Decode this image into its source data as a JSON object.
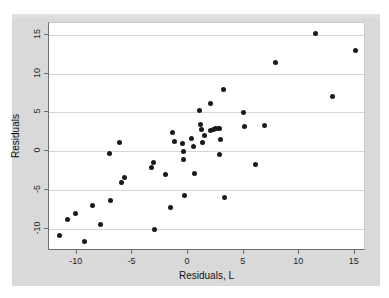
{
  "figure": {
    "background_color": "#d9d9d9",
    "plot_background_color": "#ffffff",
    "point_color": "#1a1a1a",
    "gridline_color": "#d5d5d5",
    "axis_color": "#6e6e6e"
  },
  "chart_data": {
    "type": "scatter",
    "title": "",
    "xlabel": "Residuals, L",
    "ylabel": "Residuals",
    "xlim": [
      -12.5,
      16.0
    ],
    "ylim": [
      -12.8,
      16.5
    ],
    "xticks": [
      -10,
      -5,
      0,
      5,
      10,
      15
    ],
    "xticklabels": [
      "-10",
      "-5",
      "0",
      "5",
      "10",
      "15"
    ],
    "yticks": [
      15,
      10,
      5,
      0,
      -5,
      -10
    ],
    "yticklabels": [
      "15",
      "10",
      "5",
      "0",
      "-5",
      "-10"
    ],
    "grid": "horizontal",
    "legend": null,
    "marker": "filled-circle",
    "points": [
      {
        "x": -11.6,
        "y": -10.8
      },
      {
        "x": -10.8,
        "y": -8.7
      },
      {
        "x": -10.1,
        "y": -8.0
      },
      {
        "x": -9.3,
        "y": -11.6
      },
      {
        "x": -8.6,
        "y": -7.0
      },
      {
        "x": -7.9,
        "y": -9.4
      },
      {
        "x": -7.1,
        "y": -0.3
      },
      {
        "x": -7.0,
        "y": -6.3
      },
      {
        "x": -6.2,
        "y": 1.1
      },
      {
        "x": -6.0,
        "y": -4.0
      },
      {
        "x": -5.7,
        "y": -3.3
      },
      {
        "x": -3.3,
        "y": -2.1
      },
      {
        "x": -3.1,
        "y": -1.4
      },
      {
        "x": -3.0,
        "y": -10.1
      },
      {
        "x": -2.0,
        "y": -3.0
      },
      {
        "x": -1.6,
        "y": -7.2
      },
      {
        "x": -1.4,
        "y": 2.4
      },
      {
        "x": -1.2,
        "y": 1.3
      },
      {
        "x": -0.5,
        "y": 1.0
      },
      {
        "x": -0.4,
        "y": 0.0
      },
      {
        "x": -0.4,
        "y": -1.1
      },
      {
        "x": -0.3,
        "y": -5.7
      },
      {
        "x": 0.3,
        "y": 1.6
      },
      {
        "x": 0.5,
        "y": 0.6
      },
      {
        "x": 0.6,
        "y": -2.9
      },
      {
        "x": 1.0,
        "y": 5.2
      },
      {
        "x": 1.1,
        "y": 3.4
      },
      {
        "x": 1.2,
        "y": 2.8
      },
      {
        "x": 1.3,
        "y": 1.2
      },
      {
        "x": 1.5,
        "y": 2.0
      },
      {
        "x": 2.0,
        "y": 6.2
      },
      {
        "x": 2.0,
        "y": 2.7
      },
      {
        "x": 2.3,
        "y": 2.8
      },
      {
        "x": 2.5,
        "y": 2.9
      },
      {
        "x": 2.7,
        "y": 2.9
      },
      {
        "x": 2.8,
        "y": 2.9
      },
      {
        "x": 2.8,
        "y": -0.4
      },
      {
        "x": 2.9,
        "y": 1.5
      },
      {
        "x": 3.2,
        "y": 7.9
      },
      {
        "x": 3.3,
        "y": -5.9
      },
      {
        "x": 5.0,
        "y": 5.0
      },
      {
        "x": 5.1,
        "y": 3.2
      },
      {
        "x": 6.1,
        "y": -1.7
      },
      {
        "x": 6.9,
        "y": 3.3
      },
      {
        "x": 7.9,
        "y": 11.4
      },
      {
        "x": 11.5,
        "y": 15.1
      },
      {
        "x": 13.0,
        "y": 7.0
      },
      {
        "x": 15.1,
        "y": 13.0
      }
    ]
  }
}
